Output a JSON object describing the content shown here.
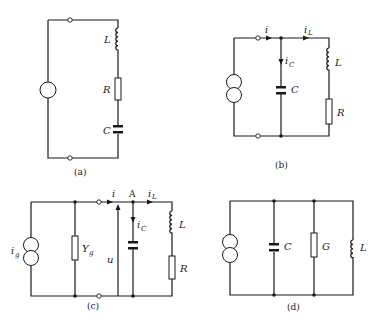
{
  "figure": {
    "circuits": [
      {
        "id": "a",
        "caption": "(a)",
        "source": "voltage-source",
        "elements": [
          {
            "type": "inductor",
            "label": "L"
          },
          {
            "type": "resistor",
            "label": "R"
          },
          {
            "type": "capacitor",
            "label": "C"
          }
        ]
      },
      {
        "id": "b",
        "caption": "(b)",
        "source": "current-source",
        "currents": {
          "i": "i",
          "iL_main": "i",
          "iL_sub": "L",
          "iC_main": "i",
          "iC_sub": "C"
        },
        "elements": [
          {
            "type": "capacitor",
            "label": "C"
          },
          {
            "type": "inductor",
            "label": "L"
          },
          {
            "type": "resistor",
            "label": "R"
          }
        ]
      },
      {
        "id": "c",
        "caption": "(c)",
        "source": "current-source",
        "source_label_main": "i",
        "source_label_sub": "g",
        "admittance_main": "Y",
        "admittance_sub": "g",
        "node_label": "A",
        "voltage_label": "u",
        "currents": {
          "i": "i",
          "iL_main": "i",
          "iL_sub": "L",
          "iC_main": "i",
          "iC_sub": "C"
        },
        "elements": [
          {
            "type": "capacitor",
            "label": ""
          },
          {
            "type": "inductor",
            "label": "L"
          },
          {
            "type": "resistor",
            "label": "R"
          }
        ]
      },
      {
        "id": "d",
        "caption": "(d)",
        "source": "current-source",
        "elements": [
          {
            "type": "capacitor",
            "label": "C"
          },
          {
            "type": "conductance",
            "label": "G"
          },
          {
            "type": "inductor",
            "label": "L"
          }
        ]
      }
    ]
  }
}
